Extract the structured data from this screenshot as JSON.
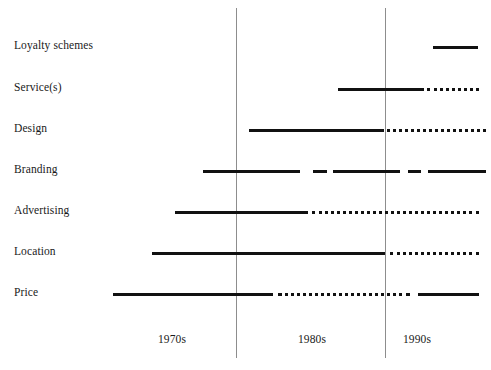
{
  "chart_data": {
    "type": "table",
    "title": "",
    "xlabel": "",
    "ylabel": "",
    "legend": [],
    "grid": true,
    "x_axis": {
      "tick_labels": [
        "1970s",
        "1980s",
        "1990s"
      ],
      "tick_positions_px": [
        172,
        312,
        417
      ],
      "gridline_positions_px": [
        236,
        385
      ]
    },
    "categories": [
      "Loyalty schemes",
      "Service(s)",
      "Design",
      "Branding",
      "Advertising",
      "Location",
      "Price"
    ],
    "rows": [
      {
        "label": "Loyalty schemes",
        "y": 46,
        "segments": [
          {
            "style": "solid",
            "x1": 433,
            "x2": 478
          }
        ]
      },
      {
        "label": "Service(s)",
        "y": 88,
        "segments": [
          {
            "style": "solid",
            "x1": 338,
            "x2": 424
          },
          {
            "style": "dotted",
            "x1": 427,
            "x2": 479
          }
        ]
      },
      {
        "label": "Design",
        "y": 129,
        "segments": [
          {
            "style": "solid",
            "x1": 249,
            "x2": 384
          },
          {
            "style": "dotted",
            "x1": 387,
            "x2": 486
          }
        ]
      },
      {
        "label": "Branding",
        "y": 170,
        "segments": [
          {
            "style": "solid",
            "x1": 203,
            "x2": 300
          },
          {
            "style": "solid",
            "x1": 313,
            "x2": 327
          },
          {
            "style": "solid",
            "x1": 333,
            "x2": 400
          },
          {
            "style": "solid",
            "x1": 408,
            "x2": 421
          },
          {
            "style": "solid",
            "x1": 428,
            "x2": 486
          }
        ]
      },
      {
        "label": "Advertising",
        "y": 211,
        "segments": [
          {
            "style": "solid",
            "x1": 175,
            "x2": 308
          },
          {
            "style": "dotted",
            "x1": 312,
            "x2": 479
          }
        ]
      },
      {
        "label": "Location",
        "y": 252,
        "segments": [
          {
            "style": "solid",
            "x1": 152,
            "x2": 385
          },
          {
            "style": "dotted",
            "x1": 390,
            "x2": 479
          }
        ]
      },
      {
        "label": "Price",
        "y": 293,
        "segments": [
          {
            "style": "solid",
            "x1": 113,
            "x2": 273
          },
          {
            "style": "dotted",
            "x1": 278,
            "x2": 410
          },
          {
            "style": "solid",
            "x1": 418,
            "x2": 479
          }
        ]
      }
    ],
    "label_y_positions": [
      46,
      88,
      129,
      170,
      211,
      252,
      293
    ],
    "tick_label_y": 334,
    "gridline_top": 8,
    "gridline_bottom": 358,
    "colors": {
      "line": "#111111",
      "gridline": "#8d8d8d",
      "text": "#1a1a1a",
      "background": "#ffffff"
    }
  }
}
